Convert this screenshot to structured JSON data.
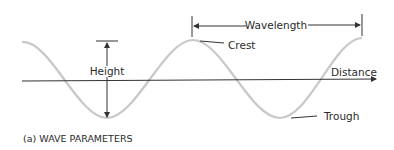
{
  "diagram": {
    "caption": "(a) WAVE PARAMETERS",
    "labels": {
      "height": "Height",
      "wavelength": "Wavelength",
      "crest": "Crest",
      "trough": "Trough",
      "distance": "Distance"
    },
    "colors": {
      "wave": "#c8c8c8",
      "lines": "#333333",
      "text": "#2a2a2a"
    }
  }
}
